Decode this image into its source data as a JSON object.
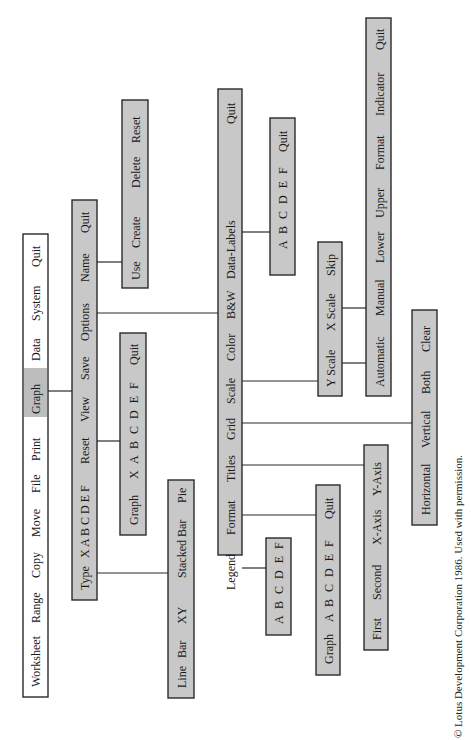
{
  "diagram": {
    "copyright": "© Lotus Development Corporation 1986. Used with permission.",
    "colors": {
      "menu_fill": "#c8c8c8",
      "main_menu_fill": "#ffffff",
      "highlight": "#bdbdbd",
      "line": "#2a2a2a"
    },
    "menus": {
      "main": {
        "items": [
          "Worksheet",
          "Range",
          "Copy",
          "Move",
          "File",
          "Print",
          "Graph",
          "Data",
          "System",
          "Quit"
        ],
        "highlighted": "Graph"
      },
      "graph": {
        "items": [
          "Type",
          "X A B C D E F",
          "Reset",
          "View",
          "Save",
          "Options",
          "Name",
          "Quit"
        ]
      },
      "type": {
        "items": [
          "Line",
          "Bar",
          "XY",
          "Stacked Bar",
          "Pie"
        ]
      },
      "reset": {
        "items": [
          "Graph",
          "X A B C D E F",
          "Quit"
        ]
      },
      "name": {
        "items": [
          "Use",
          "Create",
          "Delete",
          "Reset"
        ]
      },
      "options": {
        "items": [
          "Legend",
          "Format",
          "Titles",
          "Grid",
          "Scale",
          "Color",
          "B&W",
          "Data-Labels",
          "Quit"
        ]
      },
      "legend": {
        "items": [
          "A B C D E F"
        ]
      },
      "format": {
        "items": [
          "Graph",
          "A B C D E F",
          "Quit"
        ]
      },
      "titles": {
        "items": [
          "First",
          "Second",
          "X-Axis",
          "Y-Axis"
        ]
      },
      "grid": {
        "items": [
          "Horizontal",
          "Vertical",
          "Both",
          "Clear"
        ]
      },
      "scale": {
        "items": [
          "Y Scale",
          "X Scale",
          "Skip"
        ]
      },
      "scale_sub": {
        "items": [
          "Automatic",
          "Manual",
          "Lower",
          "Upper",
          "Format",
          "Indicator",
          "Quit"
        ]
      },
      "data_labels": {
        "items": [
          "A B C D E F",
          "Quit"
        ]
      }
    }
  }
}
